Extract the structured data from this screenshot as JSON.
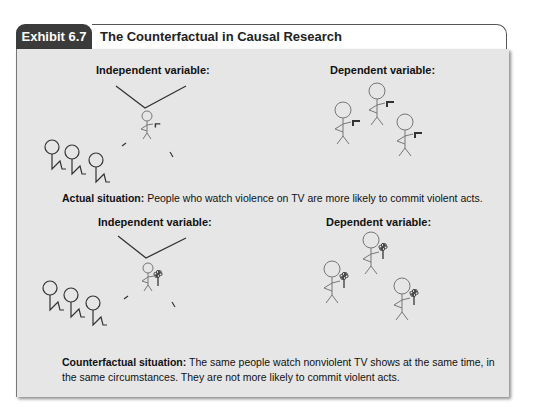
{
  "header": {
    "exhibit_label": "Exhibit 6.7",
    "title": "The Counterfactual in Causal Research"
  },
  "actual": {
    "independent_label": "Independent variable:",
    "dependent_label": "Dependent variable:",
    "caption_bold": "Actual situation:",
    "caption_text": " People who watch violence on TV are more likely to commit violent acts.",
    "tv_figure_holds": "gun",
    "dependent_figures_hold": "gun"
  },
  "counterfactual": {
    "independent_label": "Independent variable:",
    "dependent_label": "Dependent variable:",
    "caption_bold": "Counterfactual situation:",
    "caption_text": " The same people watch nonviolent TV shows at the same time, in the same circumstances. They are not more likely to commit violent acts.",
    "tv_figure_holds": "flower",
    "dependent_figures_hold": "flower"
  },
  "colors": {
    "tab_bg": "#3b3b3b",
    "panel_bg": "#e6e6e6",
    "stroke": "#555555"
  }
}
